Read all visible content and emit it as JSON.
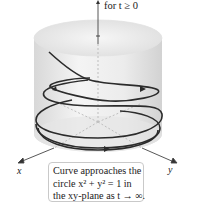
{
  "figure": {
    "top_caption": "for t ≥ 0",
    "axes": {
      "x_label": "x",
      "y_label": "y"
    },
    "note": {
      "line1": "Curve approaches the",
      "line2": "circle x² + y² = 1 in",
      "line3": "the xy-plane as t → ∞."
    }
  }
}
